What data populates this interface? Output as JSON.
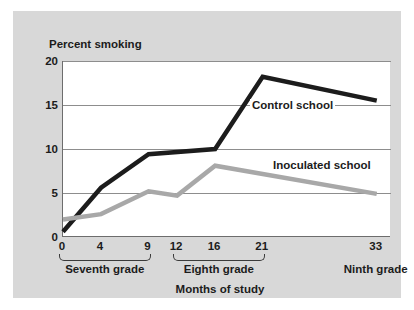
{
  "chart_data": {
    "type": "line",
    "title": "",
    "xlabel": "Months of study",
    "ylabel": "Percent smoking",
    "xlim": [
      0,
      34.5
    ],
    "ylim": [
      0,
      20
    ],
    "grid": true,
    "legend_position": "inline-annotation",
    "x_ticks": [
      0,
      4,
      9,
      12,
      16,
      21,
      33
    ],
    "x_tick_labels": [
      "0",
      "4",
      "9",
      "12",
      "16",
      "21",
      "33"
    ],
    "y_ticks": [
      0,
      5,
      10,
      15,
      20
    ],
    "y_tick_labels": [
      "0",
      "5",
      "10",
      "15",
      "20"
    ],
    "x_groups": [
      {
        "label": "Seventh grade",
        "start": 0,
        "end": 9,
        "bracket": true
      },
      {
        "label": "Eighth grade",
        "start": 12,
        "end": 21,
        "bracket": true
      },
      {
        "label": "Ninth grade",
        "start": 33,
        "end": 33,
        "bracket": false
      }
    ],
    "series": [
      {
        "name": "Control school",
        "color": "#1c1c1c",
        "width": 4.5,
        "annotation": "Control school",
        "x": [
          0,
          4,
          9,
          16,
          21,
          33
        ],
        "values": [
          0.6,
          5.6,
          9.4,
          10.0,
          18.2,
          15.5
        ]
      },
      {
        "name": "Inoculated school",
        "color": "#a8a8a8",
        "width": 4.5,
        "annotation": "Inoculated school",
        "x": [
          0,
          4,
          9,
          12,
          16,
          33
        ],
        "values": [
          2.0,
          2.6,
          5.2,
          4.7,
          8.1,
          4.9
        ]
      }
    ],
    "annotations": [
      {
        "text": "Control school",
        "x_px": 237,
        "y_px": 88,
        "leader": true
      },
      {
        "text": "Inoculated school",
        "x_px": 258,
        "y_px": 148,
        "leader": false
      }
    ]
  },
  "colors": {
    "page_background": "#ffffff",
    "panel_background": "#d8d8d8",
    "plot_background": "#ffffff",
    "axis": "#6d6d6d",
    "gridline": "#8d8d8d",
    "text": "#1c1c1c",
    "control_series": "#1c1c1c",
    "inoculated_series": "#a8a8a8"
  }
}
